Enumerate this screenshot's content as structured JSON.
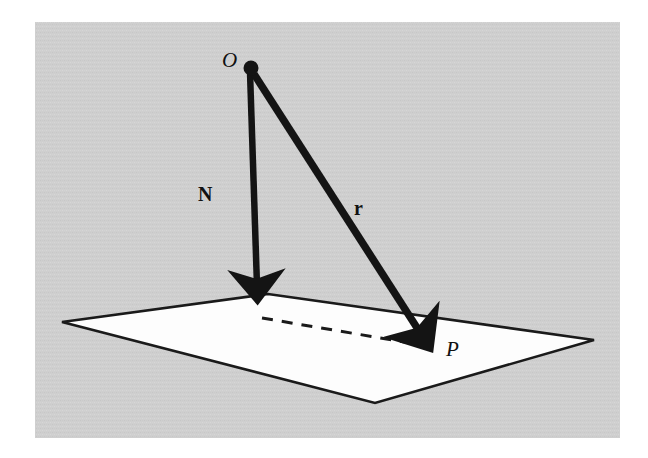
{
  "figure": {
    "background_color": "#ffffff",
    "panel_color": "#cfcfcf",
    "panel_rect": {
      "x": 35,
      "y": 22,
      "width": 585,
      "height": 416
    },
    "plane": {
      "name": "plane-surface",
      "fill_color": "#fdfdfd",
      "stroke_color": "#1a1a1a",
      "vertices": [
        {
          "name": "left-vertex",
          "x": 62,
          "y": 322
        },
        {
          "name": "top-vertex",
          "x": 268,
          "y": 294
        },
        {
          "name": "right-vertex",
          "x": 594,
          "y": 340
        },
        {
          "name": "bottom-vertex",
          "x": 375,
          "y": 403
        }
      ]
    },
    "points": [
      {
        "name": "origin-point",
        "label": "O",
        "style": "italic",
        "x": 250,
        "y": 68,
        "dot": true,
        "dot_radius": 7
      },
      {
        "name": "foot-point",
        "label": "",
        "style": "none",
        "x": 258,
        "y": 312,
        "dot": false
      },
      {
        "name": "target-point",
        "label": "P",
        "style": "italic",
        "x": 432,
        "y": 348,
        "dot": false
      }
    ],
    "vectors": [
      {
        "name": "normal-vector",
        "label": "N",
        "style": "bold",
        "from": {
          "x": 250,
          "y": 70
        },
        "to": {
          "x": 258,
          "y": 312
        },
        "color": "#141414",
        "line_width": 7
      },
      {
        "name": "position-vector",
        "label": "r",
        "style": "bold",
        "from": {
          "x": 254,
          "y": 72
        },
        "to": {
          "x": 432,
          "y": 348
        },
        "color": "#141414",
        "line_width": 8
      }
    ],
    "dashed_line": {
      "name": "projection-dashed-line",
      "from": {
        "x": 262,
        "y": 318
      },
      "to": {
        "x": 428,
        "y": 346
      },
      "color": "#1a1a1a",
      "line_width": 3,
      "dash_pattern": "11 9"
    },
    "labels": [
      {
        "name": "label-origin",
        "text": "O",
        "style": "italic",
        "x": 228,
        "y": 62
      },
      {
        "name": "label-normal",
        "text": "N",
        "style": "bold",
        "x": 205,
        "y": 196
      },
      {
        "name": "label-position",
        "text": "r",
        "style": "bold",
        "x": 359,
        "y": 210
      },
      {
        "name": "label-point-p",
        "text": "P",
        "style": "italic",
        "x": 452,
        "y": 352
      }
    ]
  }
}
